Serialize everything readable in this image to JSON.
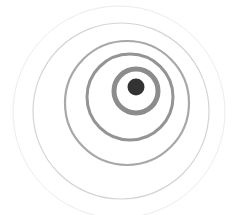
{
  "image": {
    "width": 234,
    "height": 215,
    "background": "#ffffff",
    "description": "concentric ripple rings with central dot"
  },
  "rings": [
    {
      "name": "ring-outermost",
      "cx": 119,
      "cy": 112,
      "r": 106,
      "stroke": "#ececec",
      "width": 1
    },
    {
      "name": "ring-4",
      "cx": 121,
      "cy": 111,
      "r": 88,
      "stroke": "#d4d4d4",
      "width": 1.2
    },
    {
      "name": "ring-3",
      "cx": 127,
      "cy": 103,
      "r": 62,
      "stroke": "#a8a8a8",
      "width": 2.2
    },
    {
      "name": "ring-2",
      "cx": 130,
      "cy": 97,
      "r": 43,
      "stroke": "#949494",
      "width": 3
    },
    {
      "name": "ring-1",
      "cx": 136,
      "cy": 91,
      "r": 22,
      "stroke": "#8c8c8c",
      "width": 5
    }
  ],
  "dot": {
    "cx": 136,
    "cy": 87,
    "r": 8.5,
    "fill": "#333333"
  }
}
